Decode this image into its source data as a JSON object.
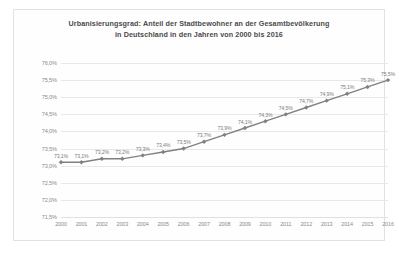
{
  "chart_data": {
    "type": "line",
    "title": "Urbanisierungsgrad: Anteil der Stadtbewohner an der Gesamtbevölkerung in Deutschland in den Jahren von 2000 bis 2016",
    "title_line1": "Urbanisierungsgrad: Anteil der Stadtbewohner an der Gesamtbevölkerung",
    "title_line2": "in Deutschland in den Jahren von 2000 bis 2016",
    "xlabel": "",
    "ylabel": "",
    "ylim": [
      71.5,
      76.0
    ],
    "ytick_step": 0.5,
    "grid": true,
    "legend": false,
    "categories": [
      "2000",
      "2001",
      "2002",
      "2003",
      "2004",
      "2005",
      "2006",
      "2007",
      "2008",
      "2009",
      "2010",
      "2011",
      "2012",
      "2013",
      "2014",
      "2015",
      "2016"
    ],
    "values": [
      73.1,
      73.1,
      73.2,
      73.2,
      73.3,
      73.4,
      73.5,
      73.7,
      73.9,
      74.1,
      74.3,
      74.5,
      74.7,
      74.9,
      75.1,
      75.3,
      75.5
    ],
    "ytick_labels": [
      "76,0%",
      "75,5%",
      "75,0%",
      "74,5%",
      "74,0%",
      "73,5%",
      "73,0%",
      "72,5%",
      "72,0%",
      "71,5%"
    ],
    "ytick_values": [
      76.0,
      75.5,
      75.0,
      74.5,
      74.0,
      73.5,
      73.0,
      72.5,
      72.0,
      71.5
    ],
    "point_labels": [
      "73,1%",
      "73,1%",
      "73,2%",
      "73,2%",
      "73,3%",
      "73,4%",
      "73,5%",
      "73,7%",
      "73,9%",
      "74,1%",
      "74,3%",
      "74,5%",
      "74,7%",
      "74,9%",
      "75,1%",
      "75,3%",
      "75,5%"
    ],
    "series_color": "#808080",
    "grid_color": "#e8e8e8",
    "label_color": "#8a8a8a",
    "title_color": "#4a4a4a"
  }
}
